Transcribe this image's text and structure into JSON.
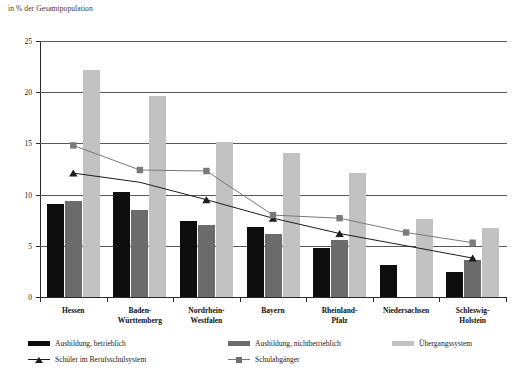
{
  "chart_data": {
    "type": "bar",
    "title": "",
    "subtitle": "",
    "ylabel": "in % der Gesamtpopulation",
    "xlabel": "",
    "ylim": [
      0,
      25
    ],
    "yticks": [
      0,
      5,
      10,
      15,
      20,
      25
    ],
    "grid": true,
    "legend_position": "bottom",
    "categories": [
      "Hessen",
      "Baden-Württemberg",
      "Nordrhein-Westfalen",
      "Bayern",
      "Rheinland-Pfalz",
      "Niedersachsen",
      "Schleswig-Holstein"
    ],
    "series": [
      {
        "name": "Ausbildung, betrieblich",
        "kind": "bar",
        "color": "#0d0d0d",
        "values": [
          9.1,
          10.3,
          7.4,
          6.8,
          4.8,
          3.1,
          2.4
        ]
      },
      {
        "name": "Ausbildung, nichtbetrieblich",
        "kind": "bar",
        "color": "#6b6b6b",
        "values": [
          9.4,
          8.5,
          7.0,
          6.2,
          5.6,
          null,
          3.6
        ]
      },
      {
        "name": "Übergangssystem",
        "kind": "bar",
        "color": "#c2c2c2",
        "values": [
          22.2,
          19.6,
          15.1,
          14.1,
          12.1,
          7.6,
          6.7
        ]
      },
      {
        "name": "Schüler im Berufsschulsystem",
        "kind": "line",
        "marker": "triangle",
        "color": "#1d1d1d",
        "values": [
          12.1,
          11.2,
          9.5,
          7.7,
          6.2,
          null,
          3.8
        ]
      },
      {
        "name": "Schulabgänger",
        "kind": "line",
        "marker": "square",
        "color": "#7a7a7a",
        "values": [
          14.8,
          12.4,
          12.3,
          8.0,
          7.7,
          6.3,
          5.3
        ]
      }
    ]
  },
  "legend": {
    "items": [
      {
        "label": "Ausbildung, betrieblich",
        "marker": "bar-black"
      },
      {
        "label": "Ausbildung, nichtbetrieblich",
        "marker": "bar-dgray"
      },
      {
        "label": "Übergangssystem",
        "marker": "bar-lgray"
      },
      {
        "label": "Schüler im Berufsschulsystem",
        "marker": "line-triangle"
      },
      {
        "label": "Schulabgänger",
        "marker": "line-square"
      }
    ]
  },
  "colors": {
    "series_betrieblich": "#0d0d0d",
    "series_nichtbetrieblich": "#6b6b6b",
    "series_uebergang": "#c2c2c2",
    "line_schueler": "#1d1d1d",
    "line_schulabgaenger": "#7a7a7a",
    "gridline": "#5a5a5a",
    "axis": "#2b2b2b",
    "background": "#ffffff"
  }
}
